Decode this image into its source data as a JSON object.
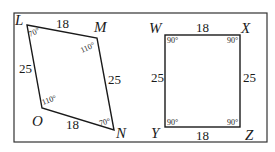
{
  "figure": {
    "frame": {
      "x": 14,
      "y": 13,
      "w": 253,
      "h": 129
    },
    "parallelogram": {
      "name": "LMNO",
      "vertices": {
        "L": {
          "x": 27,
          "y": 25
        },
        "M": {
          "x": 97,
          "y": 38
        },
        "N": {
          "x": 114,
          "y": 130
        },
        "O": {
          "x": 42,
          "y": 108
        }
      },
      "labels": {
        "L": "L",
        "M": "M",
        "N": "N",
        "O": "O"
      },
      "sides": {
        "LM": "18",
        "MN": "25",
        "NO": "18",
        "OL": "25"
      },
      "angles": {
        "L": "70°",
        "M": "110°",
        "N": "70°",
        "O": "110°"
      }
    },
    "rectangle": {
      "name": "WXZY",
      "vertices": {
        "W": {
          "x": 165,
          "y": 35
        },
        "X": {
          "x": 240,
          "y": 35
        },
        "Z": {
          "x": 240,
          "y": 127
        },
        "Y": {
          "x": 165,
          "y": 127
        }
      },
      "labels": {
        "W": "W",
        "X": "X",
        "Y": "Y",
        "Z": "Z"
      },
      "sides": {
        "WX": "18",
        "XZ": "25",
        "ZY": "18",
        "YW": "25"
      },
      "angles": {
        "W": "90°",
        "X": "90°",
        "Y": "90°",
        "Z": "90°"
      }
    },
    "colors": {
      "stroke": "#1a1a1a",
      "background": "#ffffff"
    }
  }
}
